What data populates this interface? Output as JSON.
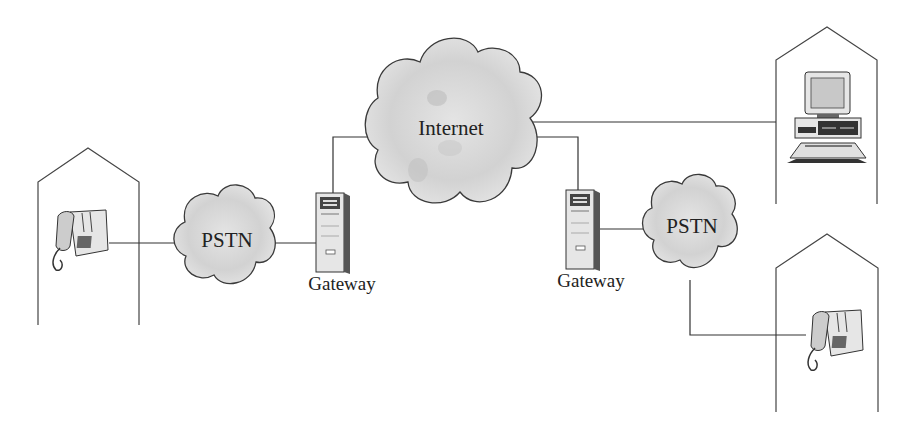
{
  "diagram": {
    "type": "network-topology",
    "nodes": [
      {
        "id": "house-left",
        "kind": "building",
        "contains": "telephone"
      },
      {
        "id": "pstn-left",
        "kind": "cloud",
        "label": "PSTN"
      },
      {
        "id": "gateway-left",
        "kind": "server",
        "label": "Gateway"
      },
      {
        "id": "internet",
        "kind": "cloud",
        "label": "Internet"
      },
      {
        "id": "gateway-right",
        "kind": "server",
        "label": "Gateway"
      },
      {
        "id": "pstn-right",
        "kind": "cloud",
        "label": "PSTN"
      },
      {
        "id": "house-top-right",
        "kind": "building",
        "contains": "computer"
      },
      {
        "id": "house-bottom-right",
        "kind": "building",
        "contains": "telephone"
      }
    ],
    "edges": [
      [
        "house-left",
        "pstn-left"
      ],
      [
        "pstn-left",
        "gateway-left"
      ],
      [
        "gateway-left",
        "internet"
      ],
      [
        "internet",
        "house-top-right"
      ],
      [
        "internet",
        "gateway-right"
      ],
      [
        "gateway-right",
        "pstn-right"
      ],
      [
        "pstn-right",
        "house-bottom-right"
      ]
    ]
  },
  "labels": {
    "pstn_left": "PSTN",
    "internet": "Internet",
    "pstn_right": "PSTN",
    "gateway_left": "Gateway",
    "gateway_right": "Gateway"
  },
  "colors": {
    "line": "#333333",
    "cloud_fill": "#d9d9d9",
    "cloud_stroke": "#3a3a3a",
    "device_fill": "#e6e6e6",
    "device_dark": "#444444"
  }
}
